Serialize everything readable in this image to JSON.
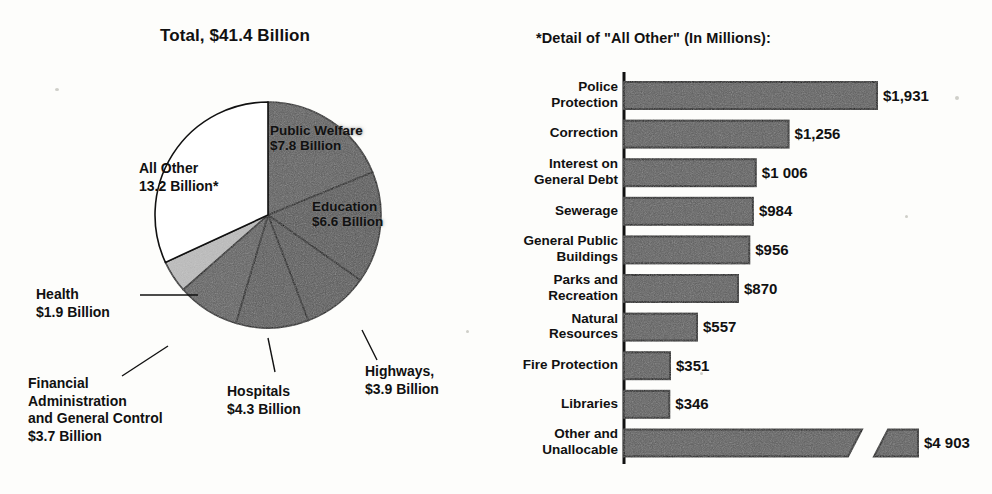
{
  "pie": {
    "title": "Total, $41.4 Billion",
    "total_billion": 41.4,
    "slices": [
      {
        "name": "Public Welfare",
        "label_line1": "Public Welfare",
        "label_line2": "$7.8 Billion",
        "value": 7.8,
        "fill": "#5d5d5d",
        "inside": true
      },
      {
        "name": "Education",
        "label_line1": "Education",
        "label_line2": "$6.6 Billion",
        "value": 6.6,
        "fill": "#575757",
        "inside": true
      },
      {
        "name": "Highways",
        "label_line1": "Highways,",
        "label_line2": "$3.9 Billion",
        "value": 3.9,
        "fill": "#585858",
        "inside": false
      },
      {
        "name": "Hospitals",
        "label_line1": "Hospitals",
        "label_line2": "$4.3 Billion",
        "value": 4.3,
        "fill": "#5a5a5a",
        "inside": false
      },
      {
        "name": "Financial Administration and General Control",
        "label_line1": "Financial",
        "label_line2": "Administration",
        "label_line3": "and General Control",
        "label_line4": "$3.7 Billion",
        "value": 3.7,
        "fill": "#606060",
        "inside": false
      },
      {
        "name": "Health",
        "label_line1": "Health",
        "label_line2": "$1.9 Billion",
        "value": 1.9,
        "fill": "#bdbdbd",
        "inside": false
      },
      {
        "name": "All Other",
        "label_line1": "All Other",
        "label_line2": "13.2 Billion*",
        "value": 13.2,
        "fill": "#ffffff",
        "inside": true
      }
    ]
  },
  "bars": {
    "title": "*Detail of \"All Other\" (In Millions):",
    "unit": "millions",
    "items": [
      {
        "label_line1": "Police",
        "label_line2": "Protection",
        "value": 1931,
        "value_label": "$1,931",
        "broken": false
      },
      {
        "label_line1": "Correction",
        "label_line2": "",
        "value": 1256,
        "value_label": "$1,256",
        "broken": false
      },
      {
        "label_line1": "Interest on",
        "label_line2": "General Debt",
        "value": 1006,
        "value_label": "$1 006",
        "broken": false
      },
      {
        "label_line1": "Sewerage",
        "label_line2": "",
        "value": 984,
        "value_label": "$984",
        "broken": false
      },
      {
        "label_line1": "General Public",
        "label_line2": "Buildings",
        "value": 956,
        "value_label": "$956",
        "broken": false
      },
      {
        "label_line1": "Parks and",
        "label_line2": "Recreation",
        "value": 870,
        "value_label": "$870",
        "broken": false
      },
      {
        "label_line1": "Natural",
        "label_line2": "Resources",
        "value": 557,
        "value_label": "$557",
        "broken": false
      },
      {
        "label_line1": "Fire Protection",
        "label_line2": "",
        "value": 351,
        "value_label": "$351",
        "broken": false
      },
      {
        "label_line1": "Libraries",
        "label_line2": "",
        "value": 346,
        "value_label": "$346",
        "broken": false
      },
      {
        "label_line1": "Other and",
        "label_line2": "Unallocable",
        "value": 4903,
        "value_label": "$4 903",
        "broken": true
      }
    ]
  },
  "chart_data": [
    {
      "type": "pie",
      "title": "Total, $41.4 Billion",
      "unit": "billions of dollars",
      "categories": [
        "Public Welfare",
        "Education",
        "Hospitals",
        "Highways",
        "Financial Administration and General Control",
        "Health",
        "All Other"
      ],
      "values": [
        7.8,
        6.6,
        4.3,
        3.9,
        3.7,
        1.9,
        13.2
      ],
      "total": 41.4,
      "legend": "none",
      "annotations": [
        "All Other 13.2 Billion* detailed in adjacent bar chart"
      ]
    },
    {
      "type": "bar",
      "orientation": "horizontal",
      "title": "*Detail of \"All Other\" (In Millions):",
      "xlabel": "",
      "ylabel": "",
      "unit": "millions of dollars",
      "grid": false,
      "legend": "none",
      "categories": [
        "Police Protection",
        "Correction",
        "Interest on General Debt",
        "Sewerage",
        "General Public Buildings",
        "Parks and Recreation",
        "Natural Resources",
        "Fire Protection",
        "Libraries",
        "Other and Unallocable"
      ],
      "values": [
        1931,
        1256,
        1006,
        984,
        956,
        870,
        557,
        351,
        346,
        4903
      ],
      "data_labels": [
        "$1,931",
        "$1,256",
        "$1 006",
        "$984",
        "$956",
        "$870",
        "$557",
        "$351",
        "$346",
        "$4 903"
      ],
      "axis_break": {
        "category": "Other and Unallocable",
        "note": "bar truncated with diagonal break"
      }
    }
  ]
}
